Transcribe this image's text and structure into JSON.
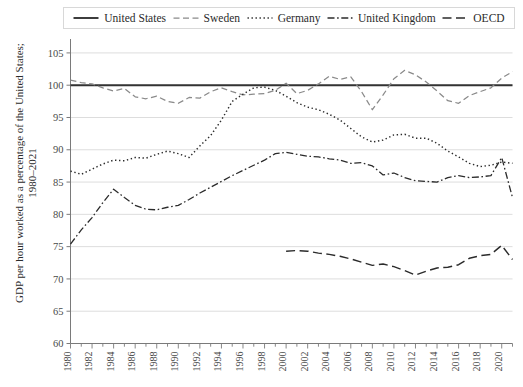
{
  "chart_data": {
    "type": "line",
    "title": "",
    "xlabel": "",
    "ylabel": "GDP per hour worked as a percentage of the United States; 1980–2021",
    "ylabel_line1": "GDP per hour worked as a percentage of the United States;",
    "ylabel_line2": "1980–2021",
    "xlim": [
      1980,
      2021
    ],
    "ylim": [
      60,
      107
    ],
    "grid": true,
    "legend_position": "top",
    "y_ticks": [
      65,
      70,
      75,
      80,
      85,
      90,
      95,
      100,
      105
    ],
    "x_ticks": [
      1980,
      1982,
      1984,
      1986,
      1988,
      1990,
      1992,
      1994,
      1996,
      1998,
      2000,
      2002,
      2004,
      2006,
      2008,
      2010,
      2012,
      2014,
      2016,
      2018,
      2020
    ],
    "x_minor_ticks": [
      1981,
      1983,
      1985,
      1987,
      1989,
      1991,
      1993,
      1995,
      1997,
      1999,
      2001,
      2003,
      2005,
      2007,
      2009,
      2011,
      2013,
      2015,
      2017,
      2019,
      2021
    ],
    "years": [
      1980,
      1981,
      1982,
      1983,
      1984,
      1985,
      1986,
      1987,
      1988,
      1989,
      1990,
      1991,
      1992,
      1993,
      1994,
      1995,
      1996,
      1997,
      1998,
      1999,
      2000,
      2001,
      2002,
      2003,
      2004,
      2005,
      2006,
      2007,
      2008,
      2009,
      2010,
      2011,
      2012,
      2013,
      2014,
      2015,
      2016,
      2017,
      2018,
      2019,
      2020,
      2021
    ],
    "series": [
      {
        "name": "United States",
        "dash": "solid",
        "color": "#333333",
        "start_year": 1980,
        "values": [
          100,
          100,
          100,
          100,
          100,
          100,
          100,
          100,
          100,
          100,
          100,
          100,
          100,
          100,
          100,
          100,
          100,
          100,
          100,
          100,
          100,
          100,
          100,
          100,
          100,
          100,
          100,
          100,
          100,
          100,
          100,
          100,
          100,
          100,
          100,
          100,
          100,
          100,
          100,
          100,
          100,
          100
        ]
      },
      {
        "name": "Sweden",
        "dash": "dashed",
        "color": "#8a8a8a",
        "start_year": 1980,
        "values": [
          100.8,
          100.4,
          100.2,
          99.6,
          99.1,
          99.5,
          98.2,
          97.9,
          98.3,
          97.5,
          97.2,
          98.1,
          98.0,
          99.0,
          99.6,
          99.0,
          98.5,
          98.6,
          98.7,
          99.2,
          100.3,
          98.7,
          99.2,
          100.2,
          101.4,
          100.9,
          101.3,
          99.0,
          96.2,
          98.5,
          101.0,
          102.3,
          101.6,
          100.5,
          99.1,
          97.6,
          97.2,
          98.4,
          99.0,
          99.6,
          101.1,
          102.1
        ]
      },
      {
        "name": "Germany",
        "dash": "dotted",
        "color": "#2b2b2b",
        "start_year": 1980,
        "values": [
          86.7,
          86.2,
          87.0,
          87.8,
          88.4,
          88.3,
          88.8,
          88.7,
          89.3,
          89.8,
          89.4,
          88.8,
          90.6,
          92.2,
          94.6,
          97.5,
          98.6,
          99.6,
          99.7,
          99.2,
          98.3,
          97.3,
          96.6,
          96.2,
          95.5,
          94.6,
          93.3,
          92.0,
          91.2,
          91.5,
          92.3,
          92.4,
          91.8,
          91.8,
          91.0,
          89.8,
          88.9,
          87.9,
          87.4,
          87.6,
          88.1,
          87.9
        ]
      },
      {
        "name": "United Kingdom",
        "dash": "dashdot",
        "color": "#2b2b2b",
        "start_year": 1980,
        "values": [
          75.4,
          77.6,
          79.5,
          81.8,
          83.9,
          82.6,
          81.4,
          80.8,
          80.7,
          81.1,
          81.4,
          82.3,
          83.3,
          84.2,
          85.1,
          86.0,
          86.8,
          87.6,
          88.4,
          89.4,
          89.6,
          89.3,
          89.0,
          88.9,
          88.6,
          88.4,
          87.9,
          88.0,
          87.5,
          86.1,
          86.4,
          85.7,
          85.2,
          85.1,
          85.0,
          85.7,
          86.0,
          85.7,
          85.8,
          86.0,
          88.8,
          82.6
        ]
      },
      {
        "name": "OECD",
        "dash": "longdash",
        "color": "#2b2b2b",
        "start_year": 2000,
        "values": [
          74.3,
          74.4,
          74.3,
          74.0,
          73.8,
          73.5,
          73.1,
          72.6,
          72.1,
          72.3,
          71.9,
          71.3,
          70.6,
          71.2,
          71.7,
          71.8,
          72.2,
          73.2,
          73.6,
          73.8,
          75.2,
          73.0
        ]
      }
    ]
  },
  "legend": {
    "items": [
      {
        "label": "United States",
        "swatch": "solid-line-swatch"
      },
      {
        "label": "Sweden",
        "swatch": "dashed-line-swatch"
      },
      {
        "label": "Germany",
        "swatch": "dotted-line-swatch"
      },
      {
        "label": "United Kingdom",
        "swatch": "dashdot-line-swatch"
      },
      {
        "label": "OECD",
        "swatch": "longdash-line-swatch"
      }
    ]
  },
  "colors": {
    "grid": "#d9d9d9",
    "axis": "#7a7a7a",
    "text": "#3a3a3a",
    "sweden": "#8a8a8a",
    "default_line": "#2b2b2b",
    "us_line": "#333333"
  }
}
